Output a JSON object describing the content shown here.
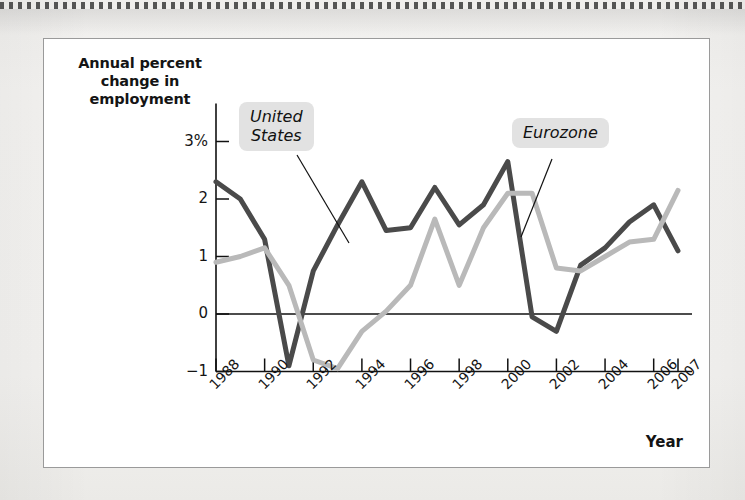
{
  "figure": {
    "y_axis_title": "Annual\npercent change\nin employment",
    "x_axis_title": "Year"
  },
  "callouts": [
    {
      "name": "united-states",
      "text": "United\nStates",
      "color": "#4a4a4a"
    },
    {
      "name": "eurozone",
      "text": "Eurozone",
      "color": "#b9b9b9"
    }
  ],
  "chart_data": {
    "type": "line",
    "title": "",
    "xlabel": "Year",
    "ylabel": "Annual percent change in employment",
    "x": [
      1988,
      1989,
      1990,
      1991,
      1992,
      1993,
      1994,
      1995,
      1996,
      1997,
      1998,
      1999,
      2000,
      2001,
      2002,
      2003,
      2004,
      2005,
      2006,
      2007
    ],
    "xlim": [
      1988,
      2007
    ],
    "ylim": [
      -1,
      3
    ],
    "yticks": [
      -1,
      0,
      1,
      2,
      3
    ],
    "ytick_labels": [
      "−1",
      "0",
      "1",
      "2",
      "3%"
    ],
    "xticks": [
      1988,
      1990,
      1992,
      1994,
      1996,
      1998,
      2000,
      2002,
      2004,
      2006,
      2007
    ],
    "xtick_labels": [
      "1988",
      "1990",
      "1992",
      "1994",
      "1996",
      "1998",
      "2000",
      "2002",
      "2004",
      "2006",
      "2007"
    ],
    "grid": false,
    "legend": "callout-labels",
    "zero_line": true,
    "series": [
      {
        "name": "United States",
        "color": "#4a4a4a",
        "width": 5,
        "values": [
          2.3,
          2.0,
          1.3,
          -0.9,
          0.75,
          1.55,
          2.3,
          1.45,
          1.5,
          2.2,
          1.55,
          1.9,
          2.65,
          -0.05,
          -0.3,
          0.85,
          1.15,
          1.6,
          1.9,
          1.1
        ]
      },
      {
        "name": "Eurozone",
        "color": "#b9b9b9",
        "width": 5,
        "values": [
          0.9,
          1.0,
          1.15,
          0.5,
          -0.8,
          -0.95,
          -0.3,
          0.05,
          0.5,
          1.65,
          0.5,
          1.5,
          2.1,
          2.1,
          0.8,
          0.75,
          1.0,
          1.25,
          1.3,
          2.15
        ]
      }
    ]
  }
}
